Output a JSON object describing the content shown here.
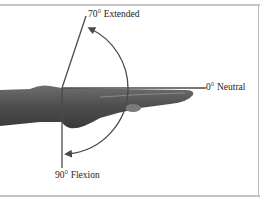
{
  "diagram": {
    "labels": {
      "extended": "70° Extended",
      "neutral": "0° Neutral",
      "flexion": "90° Flexion"
    },
    "angles": {
      "extended_deg": 70,
      "neutral_deg": 0,
      "flexion_deg": 90
    },
    "colors": {
      "line": "#4a4a4a",
      "border": "#8c8c8c",
      "hand": "#5a5a5a"
    }
  }
}
